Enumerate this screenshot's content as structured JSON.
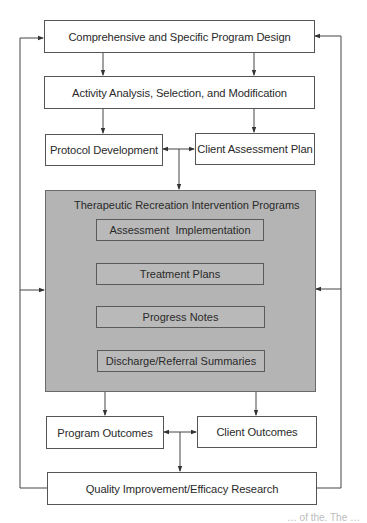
{
  "diagram": {
    "type": "flowchart",
    "nodes": {
      "program_design": "Comprehensive and Specific Program Design",
      "activity_analysis": "Activity Analysis, Selection, and Modification",
      "protocol_development": "Protocol Development",
      "client_assessment_plan": "Client Assessment Plan",
      "tr_programs": {
        "title": "Therapeutic Recreation Intervention Programs",
        "steps": [
          "Assessment  Implementation",
          "Treatment Plans",
          "Progress Notes",
          "Discharge/Referral Summaries"
        ]
      },
      "program_outcomes": "Program Outcomes",
      "client_outcomes": "Client Outcomes",
      "quality_improvement": "Quality Improvement/Efficacy Research"
    },
    "edges": [
      {
        "from": "Comprehensive and Specific Program Design",
        "to": "Activity Analysis, Selection, and Modification"
      },
      {
        "from": "Activity Analysis, Selection, and Modification",
        "to": "Protocol Development"
      },
      {
        "from": "Activity Analysis, Selection, and Modification",
        "to": "Client Assessment Plan"
      },
      {
        "from": "Protocol Development",
        "to": "Client Assessment Plan",
        "bidirectional": true
      },
      {
        "from": "Protocol Development / Client Assessment Plan",
        "to": "Therapeutic Recreation Intervention Programs"
      },
      {
        "from": "Assessment  Implementation",
        "to": "Treatment Plans"
      },
      {
        "from": "Treatment Plans",
        "to": "Progress Notes"
      },
      {
        "from": "Progress Notes",
        "to": "Discharge/Referral Summaries"
      },
      {
        "from": "Therapeutic Recreation Intervention Programs",
        "to": "Program Outcomes"
      },
      {
        "from": "Therapeutic Recreation Intervention Programs",
        "to": "Client Outcomes"
      },
      {
        "from": "Program Outcomes",
        "to": "Client Outcomes",
        "bidirectional": true
      },
      {
        "from": "Program Outcomes / Client Outcomes",
        "to": "Quality Improvement/Efficacy Research"
      },
      {
        "from": "Quality Improvement/Efficacy Research",
        "to": "Comprehensive and Specific Program Design",
        "side": "left and right feedback loops"
      },
      {
        "from": "Quality Improvement/Efficacy Research",
        "to": "Therapeutic Recreation Intervention Programs",
        "side": "left and right feedback loops"
      }
    ],
    "colors": {
      "line": "#444444",
      "shaded_fill": "#b4b4b4",
      "box_fill": "#ffffff"
    }
  },
  "caption_fragment": "… of the. The …"
}
